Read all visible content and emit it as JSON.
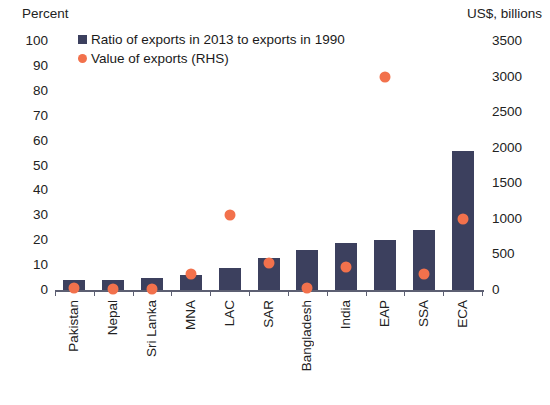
{
  "chart_data": {
    "type": "bar",
    "title": "",
    "subtitle": "",
    "categories": [
      "Pakistan",
      "Nepal",
      "Sri Lanka",
      "MNA",
      "LAC",
      "SAR",
      "Bangladesh",
      "India",
      "EAP",
      "SSA",
      "ECA"
    ],
    "series": [
      {
        "name": "Ratio of exports in 2013 to exports in 1990",
        "type": "bar",
        "axis": "left",
        "color": "#3c405e",
        "values": [
          4,
          4,
          5,
          6,
          9,
          13,
          16,
          19,
          20,
          24,
          56
        ]
      },
      {
        "name": "Value of exports (RHS)",
        "type": "scatter",
        "axis": "right",
        "color": "#f2714c",
        "values": [
          30,
          10,
          20,
          230,
          1050,
          380,
          30,
          320,
          3000,
          230,
          1000
        ]
      }
    ],
    "xlabel": "",
    "ylabel": "Percent",
    "y2label": "US$, billions",
    "ylim": [
      0,
      100
    ],
    "y2lim": [
      0,
      3500
    ],
    "yticks": [
      0,
      10,
      20,
      30,
      40,
      50,
      60,
      70,
      80,
      90,
      100
    ],
    "y2ticks": [
      0,
      500,
      1000,
      1500,
      2000,
      2500,
      3000,
      3500
    ],
    "grid": false,
    "legend_position": "top-left"
  },
  "axes": {
    "left_title": "Percent",
    "right_title": "US$, billions",
    "left_ticks": [
      "100",
      "90",
      "80",
      "70",
      "60",
      "50",
      "40",
      "30",
      "20",
      "10",
      "0"
    ],
    "right_ticks": [
      "3500",
      "3000",
      "2500",
      "2000",
      "1500",
      "1000",
      "500",
      "0"
    ]
  },
  "legend": {
    "items": [
      {
        "label": "Ratio of exports in 2013 to exports in 1990",
        "marker": "square-marker",
        "color": "#3c405e"
      },
      {
        "label": "Value of exports (RHS)",
        "marker": "circle-marker",
        "color": "#f2714c"
      }
    ]
  }
}
